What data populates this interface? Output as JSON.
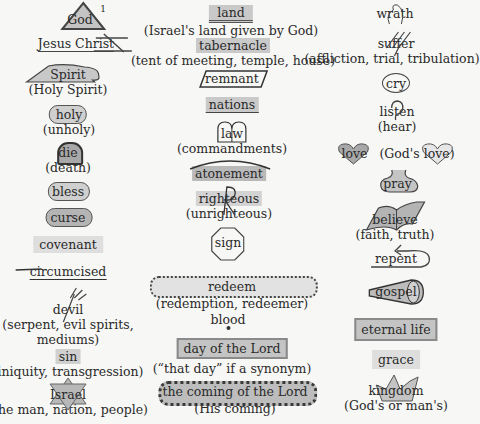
{
  "page": {
    "footnote_marker": "1"
  },
  "columns": {
    "left": [
      {
        "id": "god",
        "word": "God",
        "symbol": "triangle"
      },
      {
        "id": "jesus",
        "word": "Jesus Christ",
        "symbol": "cross-underline"
      },
      {
        "id": "spirit",
        "word": "Spirit",
        "sub": "(Holy Spirit)",
        "symbol": "cloud-dove"
      },
      {
        "id": "holy",
        "word": "holy",
        "sub": "(unholy)",
        "symbol": "cloud-fill"
      },
      {
        "id": "die",
        "word": "die",
        "sub": "(death)",
        "symbol": "tombstone"
      },
      {
        "id": "bless",
        "word": "bless",
        "symbol": "cloud-fill"
      },
      {
        "id": "curse",
        "word": "curse",
        "symbol": "cloud-gray"
      },
      {
        "id": "covenant",
        "word": "covenant",
        "symbol": "highlight-light"
      },
      {
        "id": "circumcised",
        "word": "circumcised",
        "symbol": "knife-underline"
      },
      {
        "id": "devil",
        "word": "devil",
        "sub": "(serpent, evil spirits,",
        "sub2": "mediums)",
        "symbol": "pitchfork"
      },
      {
        "id": "sin",
        "word": "sin",
        "sub": "(iniquity, transgression)",
        "symbol": "highlight-gray"
      },
      {
        "id": "israel",
        "word": "Israel",
        "sub": "(the man, nation, people)",
        "symbol": "star-of-david"
      }
    ],
    "middle": [
      {
        "id": "land",
        "word": "land",
        "sub": "(Israel's land given by God)",
        "symbol": "double-underline-highlight"
      },
      {
        "id": "tabernacle",
        "word": "tabernacle",
        "sub": "(tent of meeting, temple, house)",
        "symbol": "highlight-gray"
      },
      {
        "id": "remnant",
        "word": "remnant",
        "symbol": "parallelogram"
      },
      {
        "id": "nations",
        "word": "nations",
        "symbol": "highlight-underline"
      },
      {
        "id": "law",
        "word": "law",
        "sub": "(commandments)",
        "symbol": "tablets"
      },
      {
        "id": "atonement",
        "word": "atonement",
        "symbol": "arc-highlight"
      },
      {
        "id": "righteous",
        "word": "righteous",
        "sub": "(unrighteous)",
        "symbol": "R-highlight"
      },
      {
        "id": "sign",
        "word": "sign",
        "symbol": "octagon"
      },
      {
        "id": "redeem",
        "word": "redeem",
        "sub": "(redemption, redeemer)",
        "symbol": "scalloped"
      },
      {
        "id": "blood",
        "word": "blood",
        "symbol": "drop"
      },
      {
        "id": "day",
        "word": "day of the Lord",
        "sub": "(“that day” if a synonym)",
        "symbol": "box"
      },
      {
        "id": "coming",
        "word": "the coming of the Lord",
        "sub": "(His coming)",
        "symbol": "cloud-dark"
      }
    ],
    "right": [
      {
        "id": "wrath",
        "word": "wrath",
        "symbol": "flame"
      },
      {
        "id": "suffer",
        "word": "suffer",
        "sub": "(affliction, trial, tribulation)",
        "symbol": "slashes"
      },
      {
        "id": "cry",
        "word": "cry",
        "symbol": "circle"
      },
      {
        "id": "listen",
        "word": "listen",
        "sub": "(hear)",
        "symbol": "ear"
      },
      {
        "id": "love",
        "word": "love",
        "sub": "(God's",
        "sub_word": "love",
        "sub_end": ")",
        "symbol": "heart"
      },
      {
        "id": "pray",
        "word": "pray",
        "symbol": "prayer-shape"
      },
      {
        "id": "believe",
        "word": "believe",
        "sub": "(faith, truth)",
        "symbol": "open-book"
      },
      {
        "id": "repent",
        "word": "repent",
        "symbol": "u-turn"
      },
      {
        "id": "gospel",
        "word": "gospel",
        "symbol": "megaphone"
      },
      {
        "id": "eternal",
        "word": "eternal life",
        "symbol": "box"
      },
      {
        "id": "grace",
        "word": "grace",
        "symbol": "highlight-light"
      },
      {
        "id": "kingdom",
        "word": "kingdom",
        "sub": "(God's or man's)",
        "symbol": "crown"
      }
    ]
  },
  "colors": {
    "background": "#f7f7f5",
    "text": "#2a2a2a",
    "highlight_gray": "#c9c9c9",
    "highlight_light": "#dedede",
    "shape_fill": "#b8b8b8",
    "outline": "#555555"
  }
}
